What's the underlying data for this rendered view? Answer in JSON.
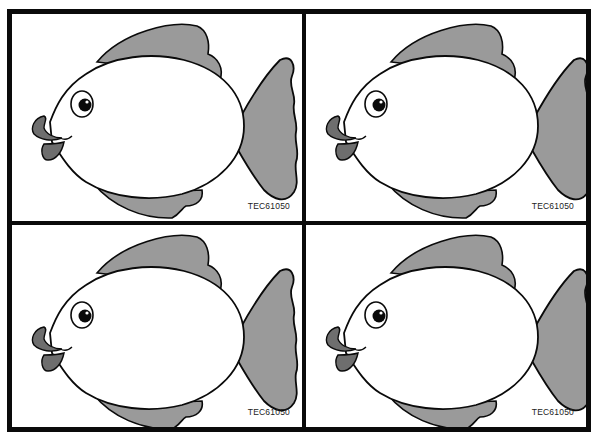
{
  "sheet": {
    "panels": [
      {
        "code": "TEC61050",
        "subject": "fish"
      },
      {
        "code": "TEC61050",
        "subject": "fish"
      },
      {
        "code": "TEC61050",
        "subject": "fish"
      },
      {
        "code": "TEC61050",
        "subject": "fish"
      }
    ],
    "colors": {
      "outline": "#0a0a0a",
      "fin_fill": "#9a9a9a",
      "body_fill": "#ffffff",
      "lip_fill": "#6e6e6e"
    }
  }
}
